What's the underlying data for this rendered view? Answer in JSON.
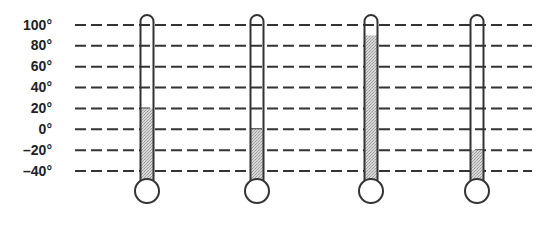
{
  "diagram": {
    "title": "",
    "scale": {
      "unit": "°",
      "labels": [
        "100°",
        "80°",
        "60°",
        "40°",
        "20°",
        "0°",
        "–20°",
        "–40°"
      ],
      "values": [
        100,
        80,
        60,
        40,
        20,
        0,
        -20,
        -40
      ]
    },
    "thermometers": [
      {
        "id": 1,
        "reading": 20
      },
      {
        "id": 2,
        "reading": 0
      },
      {
        "id": 3,
        "reading": 90
      },
      {
        "id": 4,
        "reading": -20
      }
    ],
    "colors": {
      "line": "#333333",
      "fill": "#c8c8c8",
      "background": "#ffffff"
    }
  }
}
